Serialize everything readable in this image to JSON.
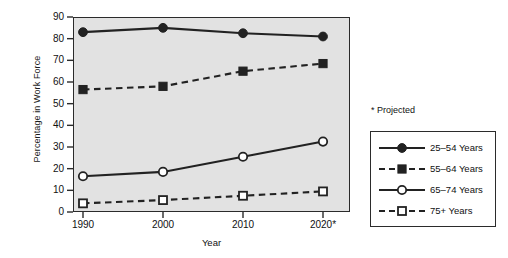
{
  "chart_data": {
    "type": "line",
    "title": "",
    "xlabel": "Year",
    "ylabel": "Percentage in Work Force",
    "categories": [
      "1990",
      "2000",
      "2010",
      "2020*"
    ],
    "x": [
      1990,
      2000,
      2010,
      2020
    ],
    "xlim": [
      1985,
      2025
    ],
    "ylim": [
      0,
      90
    ],
    "yticks": [
      0,
      10,
      20,
      30,
      40,
      50,
      60,
      70,
      80,
      90
    ],
    "xticklabels": [
      "1990",
      "2000",
      "2010",
      "2020*"
    ],
    "grid": false,
    "legend_position": "right",
    "annotations": [
      "* Projected"
    ],
    "series": [
      {
        "name": "25–54 Years",
        "values": [
          83,
          85,
          82.5,
          81
        ],
        "marker": "filled-circle",
        "linestyle": "solid",
        "color": "#222222"
      },
      {
        "name": "55–64 Years",
        "values": [
          56.5,
          58,
          65,
          68.5
        ],
        "marker": "filled-square",
        "linestyle": "dashed",
        "color": "#222222"
      },
      {
        "name": "65–74 Years",
        "values": [
          16.5,
          18.5,
          25.5,
          32.5
        ],
        "marker": "open-circle",
        "linestyle": "solid",
        "color": "#222222"
      },
      {
        "name": "75+ Years",
        "values": [
          4,
          5.5,
          7.5,
          9.5
        ],
        "marker": "open-square",
        "linestyle": "dashed",
        "color": "#222222"
      }
    ]
  },
  "axes": {
    "ylabel": "Percentage in Work Force",
    "xlabel": "Year",
    "ytick_labels": [
      "90",
      "80",
      "70",
      "60",
      "50",
      "40",
      "30",
      "20",
      "10",
      "0"
    ],
    "xtick_labels": [
      "1990",
      "2000",
      "2010",
      "2020*"
    ]
  },
  "note": {
    "projected": "* Projected"
  },
  "legend": {
    "entries": [
      {
        "label": "25–54 Years",
        "marker": "filled-circle",
        "linestyle": "solid"
      },
      {
        "label": "55–64 Years",
        "marker": "filled-square",
        "linestyle": "dashed"
      },
      {
        "label": "65–74 Years",
        "marker": "open-circle",
        "linestyle": "solid"
      },
      {
        "label": "75+ Years",
        "marker": "open-square",
        "linestyle": "dashed"
      }
    ]
  },
  "colors": {
    "plot_background": "#e2e2e2",
    "page_background": "#ffffff",
    "ink": "#222222"
  }
}
